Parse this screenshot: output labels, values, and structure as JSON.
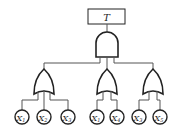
{
  "diagram": {
    "type": "fault-tree",
    "top_event": {
      "label": "T"
    },
    "top_gate": {
      "type": "AND"
    },
    "intermediate_gates": [
      {
        "type": "OR",
        "inputs": [
          "X",
          "X",
          "X"
        ],
        "subscripts": [
          "1",
          "2",
          "3"
        ]
      },
      {
        "type": "OR",
        "inputs": [
          "X",
          "X"
        ],
        "subscripts": [
          "1",
          "4"
        ]
      },
      {
        "type": "OR",
        "inputs": [
          "X",
          "X"
        ],
        "subscripts": [
          "3",
          "5"
        ]
      }
    ],
    "leaves": [
      {
        "base": "X",
        "sub": "1"
      },
      {
        "base": "X",
        "sub": "2"
      },
      {
        "base": "X",
        "sub": "3"
      },
      {
        "base": "X",
        "sub": "1"
      },
      {
        "base": "X",
        "sub": "4"
      },
      {
        "base": "X",
        "sub": "3"
      },
      {
        "base": "X",
        "sub": "5"
      }
    ],
    "colors": {
      "stroke": "#222222",
      "connector": "#555555",
      "background": "#ffffff"
    }
  }
}
